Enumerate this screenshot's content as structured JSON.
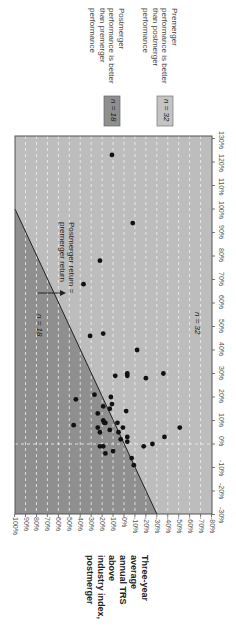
{
  "chart_data": {
    "type": "scatter",
    "orientation": "rotated-90-clockwise",
    "title": "",
    "xlabel": "Three-year average annual TRS above industry index, premerger",
    "ylabel": "Three-year average annual TRS above industry index, postmerger",
    "ylabel_lines": [
      "Three-year",
      "average",
      "annual TRS",
      "above",
      "industry index,",
      "postmerger"
    ],
    "xlim": [
      -30,
      130
    ],
    "ylim": [
      -80,
      100
    ],
    "x_ticks": [
      "-30%",
      "-20%",
      "-10%",
      "0%",
      "10%",
      "20%",
      "30%",
      "40%",
      "50%",
      "60%",
      "70%",
      "80%",
      "90%",
      "100%",
      "110%",
      "120%",
      "130%"
    ],
    "y_ticks": [
      "100%",
      "90%",
      "80%",
      "70%",
      "60%",
      "50%",
      "40%",
      "30%",
      "20%",
      "10%",
      "0%",
      "-10%",
      "-20%",
      "-30%",
      "-40%",
      "-50%",
      "-60%",
      "-70%",
      "-80%"
    ],
    "grid": "dashed white, every 10%",
    "reference_line": {
      "label": "Postmerger return = premerger return",
      "equation": "y = x"
    },
    "regions": [
      {
        "name": "above-line",
        "label": "n = 18",
        "description": "Postmerger performance is better than premerger performance",
        "color": "#8c8c8c"
      },
      {
        "name": "below-line",
        "label": "n = 32",
        "description": "Premerger performance is better than postmerger performance",
        "color": "#b9b9b9"
      }
    ],
    "points": [
      {
        "x": 123,
        "y": 11
      },
      {
        "x": 94,
        "y": -8
      },
      {
        "x": 78,
        "y": 22
      },
      {
        "x": 68,
        "y": 37
      },
      {
        "x": 46,
        "y": 31
      },
      {
        "x": 47,
        "y": 19
      },
      {
        "x": 40,
        "y": -12
      },
      {
        "x": 29,
        "y": 8
      },
      {
        "x": 30,
        "y": -3
      },
      {
        "x": 29,
        "y": -3
      },
      {
        "x": 28,
        "y": -20
      },
      {
        "x": 30,
        "y": -36
      },
      {
        "x": 19,
        "y": 44
      },
      {
        "x": 21,
        "y": 27
      },
      {
        "x": 8,
        "y": 46
      },
      {
        "x": 16,
        "y": 19
      },
      {
        "x": 20,
        "y": 12
      },
      {
        "x": 17,
        "y": 11
      },
      {
        "x": 15,
        "y": 13
      },
      {
        "x": 13,
        "y": 24
      },
      {
        "x": 10,
        "y": 19
      },
      {
        "x": 9,
        "y": 17
      },
      {
        "x": 7,
        "y": 24
      },
      {
        "x": 5,
        "y": 22
      },
      {
        "x": 6,
        "y": 13
      },
      {
        "x": 14,
        "y": -2
      },
      {
        "x": 9,
        "y": 18
      },
      {
        "x": 9,
        "y": 6
      },
      {
        "x": 7,
        "y": 1
      },
      {
        "x": 5,
        "y": 5
      },
      {
        "x": 3,
        "y": -3
      },
      {
        "x": 2,
        "y": 3
      },
      {
        "x": 1,
        "y": -3
      },
      {
        "x": -1,
        "y": -18
      },
      {
        "x": 0,
        "y": -26
      },
      {
        "x": 3,
        "y": -37
      },
      {
        "x": 7,
        "y": -51
      },
      {
        "x": -1,
        "y": 22
      },
      {
        "x": -1,
        "y": 19
      },
      {
        "x": -3,
        "y": 10
      },
      {
        "x": -4,
        "y": 17
      },
      {
        "x": -6,
        "y": -7
      },
      {
        "x": -9,
        "y": -9
      }
    ]
  },
  "legend": {
    "items": [
      {
        "badge": "n = 18",
        "lines": [
          "Postmerger",
          "performance is better",
          "than premerger",
          "performance"
        ],
        "color": "#8c8c8c"
      },
      {
        "badge": "n = 32",
        "lines": [
          "Premerger",
          "performance is better",
          "than postmerger",
          "performance"
        ],
        "color": "#bdbdbd"
      }
    ]
  },
  "annotations": {
    "line_label_1": "Postmerger return =",
    "line_label_2": "premerger return",
    "n_upper": "n = 18",
    "n_lower": "n = 32"
  },
  "axis_title": {
    "lines": [
      "Three-year",
      "average",
      "annual TRS",
      "above",
      "industry index,",
      "postmerger"
    ]
  }
}
